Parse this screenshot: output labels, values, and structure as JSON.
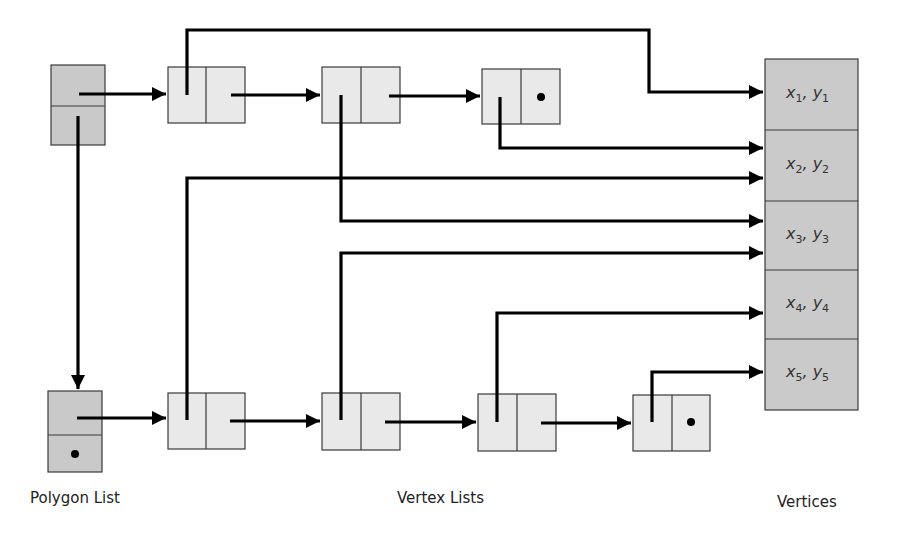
{
  "diagram": {
    "colors": {
      "polygon_node_fill": "#c9c9c9",
      "vertex_node_fill": "#e9e9e9",
      "vertex_table_fill": "#cacaca",
      "stroke": "#3a3a3a",
      "arrow": "#000000",
      "background": "#ffffff"
    },
    "labels": {
      "polygon_list": "Polygon List",
      "vertex_lists": "Vertex Lists",
      "vertices": "Vertices"
    },
    "polygon_list": [
      {
        "id": "P1",
        "next": "P2",
        "first_vertex": "A"
      },
      {
        "id": "P2",
        "next": null,
        "first_vertex": "D"
      }
    ],
    "vertex_lists": [
      {
        "polygon": "P1",
        "nodes": [
          {
            "id": "A",
            "vertex": "v1",
            "next": "B"
          },
          {
            "id": "B",
            "vertex": "v3",
            "next": "C"
          },
          {
            "id": "C",
            "vertex": "v2",
            "next": null
          }
        ]
      },
      {
        "polygon": "P2",
        "nodes": [
          {
            "id": "D",
            "vertex": "v2",
            "next": "E"
          },
          {
            "id": "E",
            "vertex": "v3",
            "next": "F"
          },
          {
            "id": "F",
            "vertex": "v4",
            "next": "G"
          },
          {
            "id": "G",
            "vertex": "v5",
            "next": null
          }
        ]
      }
    ],
    "vertices": [
      {
        "id": "v1",
        "x": "x",
        "y": "y",
        "sub": "1"
      },
      {
        "id": "v2",
        "x": "x",
        "y": "y",
        "sub": "2"
      },
      {
        "id": "v3",
        "x": "x",
        "y": "y",
        "sub": "3"
      },
      {
        "id": "v4",
        "x": "x",
        "y": "y",
        "sub": "4"
      },
      {
        "id": "v5",
        "x": "x",
        "y": "y",
        "sub": "5"
      }
    ]
  }
}
